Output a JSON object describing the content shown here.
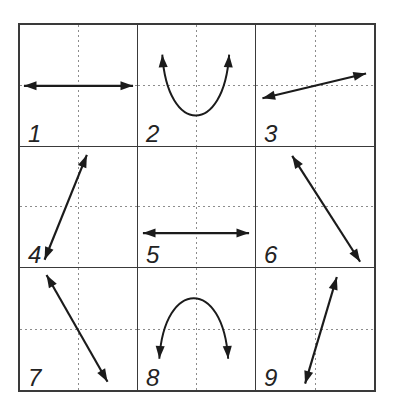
{
  "figure": {
    "name": "numbered-arrow-grid",
    "grid": {
      "rows": 3,
      "cols": 3
    },
    "colors": {
      "grid_line": "#3a3a3a",
      "dashed_line": "#8c8c8c",
      "arrow": "#1b1b1b",
      "label": "#232323",
      "background": "#ffffff"
    },
    "stroke": {
      "line": 2.2,
      "arc": 2.0
    },
    "arrow_head": {
      "length": 12.8,
      "half_width": 4.6
    },
    "cell_viewbox": "0 0 119 122",
    "cells": [
      {
        "label": "1",
        "arrow": {
          "name": "horizontal-double-arrow",
          "kind": "line",
          "path": "M 4 61.5 L 115 61.5",
          "heads": [
            {
              "x": 4,
              "y": 61.5,
              "angle": 180
            },
            {
              "x": 115,
              "y": 61.5,
              "angle": 0
            }
          ]
        }
      },
      {
        "label": "2",
        "arrow": {
          "name": "u-curve-double-arrow-up",
          "kind": "arc",
          "path": "M 24.7 30 C 30 112, 87.4 112, 92.7 30",
          "heads": [
            {
              "x": 24.7,
              "y": 30,
              "angle": -94
            },
            {
              "x": 92.7,
              "y": 30,
              "angle": -86
            }
          ]
        }
      },
      {
        "label": "3",
        "arrow": {
          "name": "shallow-diagonal-double-arrow-up-right",
          "kind": "line",
          "path": "M 6.5 74 L 111 49",
          "heads": [
            {
              "x": 6.5,
              "y": 74,
              "angle": 166.5
            },
            {
              "x": 111,
              "y": 49,
              "angle": -13.5
            }
          ]
        }
      },
      {
        "label": "4",
        "arrow": {
          "name": "steep-diagonal-double-arrow-up-right",
          "kind": "line",
          "path": "M 25 114 L 68 8",
          "heads": [
            {
              "x": 25,
              "y": 114,
              "angle": 112.1
            },
            {
              "x": 68,
              "y": 8,
              "angle": -67.9
            }
          ]
        }
      },
      {
        "label": "5",
        "arrow": {
          "name": "horizontal-double-arrow",
          "kind": "line",
          "path": "M 5 87 L 113 87",
          "heads": [
            {
              "x": 5,
              "y": 87,
              "angle": 180
            },
            {
              "x": 113,
              "y": 87,
              "angle": 0
            }
          ]
        }
      },
      {
        "label": "6",
        "arrow": {
          "name": "steep-diagonal-double-arrow-down-right",
          "kind": "line",
          "path": "M 36.5 9 L 105 116",
          "heads": [
            {
              "x": 36.5,
              "y": 9,
              "angle": -122.6
            },
            {
              "x": 105,
              "y": 116,
              "angle": 57.4
            }
          ]
        }
      },
      {
        "label": "7",
        "arrow": {
          "name": "steep-diagonal-double-arrow-down-right",
          "kind": "line",
          "path": "M 27 7 L 89 114",
          "heads": [
            {
              "x": 27,
              "y": 7,
              "angle": -120.1
            },
            {
              "x": 89,
              "y": 114,
              "angle": 59.9
            }
          ]
        }
      },
      {
        "label": "8",
        "arrow": {
          "name": "arch-double-arrow-down",
          "kind": "arc",
          "path": "M 21.7 91 C 27 10, 86.4 10, 91.7 91",
          "heads": [
            {
              "x": 21.7,
              "y": 91,
              "angle": 94
            },
            {
              "x": 91.7,
              "y": 91,
              "angle": 86
            }
          ]
        }
      },
      {
        "label": "9",
        "arrow": {
          "name": "steep-diagonal-double-arrow-up-right",
          "kind": "line",
          "path": "M 49.5 116 L 81.5 9",
          "heads": [
            {
              "x": 49.5,
              "y": 116,
              "angle": 106.7
            },
            {
              "x": 81.5,
              "y": 9,
              "angle": -73.3
            }
          ]
        }
      }
    ]
  }
}
